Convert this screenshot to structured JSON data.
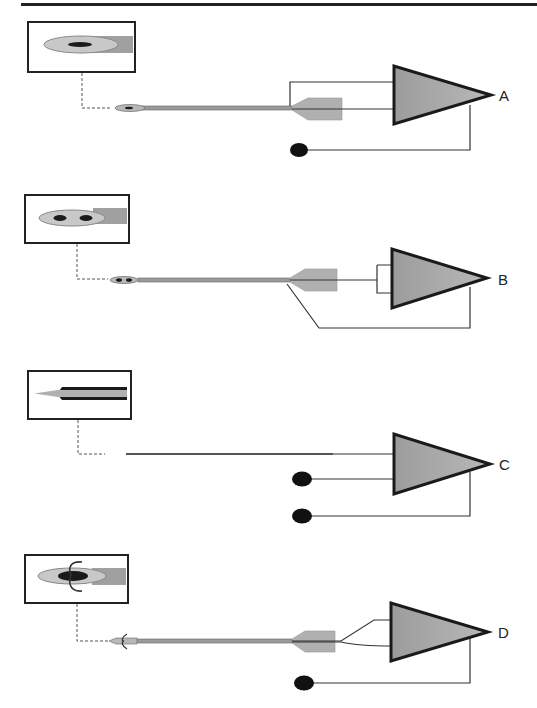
{
  "diagram": {
    "panels": [
      {
        "id": "A",
        "label": "A",
        "electrode": "concentric needle electrode",
        "inset": "concentric core in cannula",
        "inputs": [
          "cannula shaft",
          "core wire"
        ],
        "ground": true
      },
      {
        "id": "B",
        "label": "B",
        "electrode": "bipolar concentric needle electrode",
        "inset": "two cores in cannula",
        "inputs": [
          "core 1",
          "core 2"
        ],
        "ground": "cannula"
      },
      {
        "id": "C",
        "label": "C",
        "electrode": "monopolar needle electrode",
        "inset": "insulated needle with bare tip",
        "inputs": [
          "needle",
          "reference surface electrode"
        ],
        "ground": true
      },
      {
        "id": "D",
        "label": "D",
        "electrode": "hooked wire electrode",
        "inset": "wire pair with hooks",
        "inputs": [
          "wire 1",
          "wire 2"
        ],
        "ground": true
      }
    ]
  },
  "colors": {
    "amp_fill": "#a8a8a8",
    "amp_stroke": "#1a1a1a",
    "needle": "#9a9a9a",
    "hub": "#b0b0b0",
    "ellipse": "#c8c8c8",
    "core": "#1a1a1a",
    "line": "#333333",
    "top_rule": "#222222"
  }
}
